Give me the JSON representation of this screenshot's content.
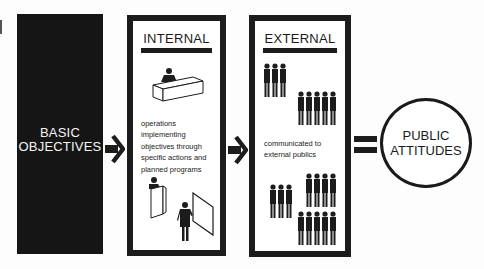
{
  "diagram": {
    "basic": {
      "line1": "BASIC",
      "line2": "OBJECTIVES"
    },
    "internal": {
      "title": "INTERNAL",
      "description_lines": [
        "operations",
        "implementing",
        "objectives through",
        "specific actions and",
        "planned programs"
      ],
      "illustrations": [
        "desk-figure-icon",
        "podium-speaker-icon",
        "presenter-board-icon"
      ]
    },
    "external": {
      "title": "EXTERNAL",
      "description_lines": [
        "communicated to",
        "external publics"
      ],
      "illustrations": [
        "crowd-3-icon",
        "crowd-5-icon",
        "crowd-3-icon",
        "crowd-4-icon",
        "crowd-5-icon"
      ]
    },
    "connectors": [
      "arrow-right-icon",
      "arrow-right-icon",
      "equals-icon"
    ],
    "result": {
      "line1": "PUBLIC",
      "line2": "ATTITUDES"
    },
    "colors": {
      "ink": "#1c1c1c",
      "background": "#fdfdfd",
      "basic_fill": "#151515"
    }
  }
}
